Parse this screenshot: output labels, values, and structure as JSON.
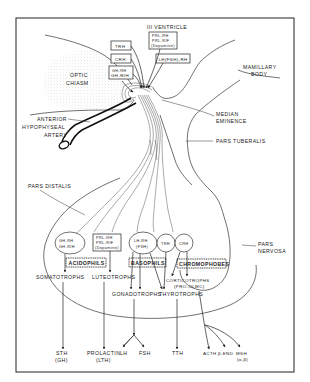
{
  "figure": {
    "ventricle_label": "III VENTRICLE",
    "regions": {
      "optic_chiasm": [
        "OPTIC",
        "CHIASM"
      ],
      "mamillary_body": [
        "MAMILLARY",
        "BODY"
      ],
      "median_eminence": [
        "MEDIAN",
        "EMINENCE"
      ],
      "pars_tuberalis": "PARS TUBERALIS",
      "pars_distalis": "PARS DISTALIS",
      "pars_nervosa": [
        "PARS",
        "NERVOSA"
      ],
      "anterior_hypophyseal_artery": [
        "ANTERIOR",
        "HYPOPHYSEAL",
        "ARTERY"
      ]
    },
    "hypothalamic_factors": {
      "trh": "TRH",
      "crh": "CRH",
      "gh": [
        "GH-RH",
        "GH-RIH"
      ],
      "prl": [
        "PRL-RH",
        "PRL-RIF",
        "(Dopamine)"
      ],
      "lh": "LH(FSH)-RH"
    },
    "pituitary_receptors": {
      "gh_cell": [
        "GH-RH",
        "GH-RIH"
      ],
      "prl_box": [
        "PRL-RH",
        "PRL-RIF",
        "(Dopamine)"
      ],
      "lh_cell": [
        "LH-RH",
        "(FSH)"
      ],
      "trh_cell": "TRH",
      "crh_cell": "CRH"
    },
    "cell_groups": {
      "acidophils": "ACIDOPHILS",
      "basophils": "BASOPHILS",
      "chromophobes": "CHROMOPHOBES"
    },
    "cell_types": {
      "somatotrophs": "SOMATOTROPHS",
      "luteotrophs": "LUTEOTROPHS",
      "gonadotrophs": "GONADOTROPHS",
      "thyrotrophs": "THYROTROPHS",
      "corticotrophs": [
        "CORTICOTROPHS",
        "(PRO-OLMC)"
      ]
    },
    "hormones": {
      "sth": [
        "STH",
        "(GH)"
      ],
      "prolactin": [
        "PROLACTIN",
        "(LTH)"
      ],
      "lh": "LH",
      "fsh": "FSH",
      "tth": "TTH",
      "acth": "ACTH",
      "b_end": "β-END",
      "msh": [
        "MSH",
        "(α,β)"
      ]
    }
  }
}
